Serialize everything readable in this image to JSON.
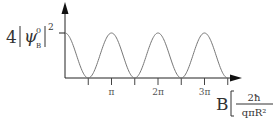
{
  "chart_data": {
    "type": "line",
    "title": "",
    "ylabel": {
      "coefficient": "4",
      "symbol": "ψ",
      "superscript": "0",
      "subscript": "B",
      "power": "2"
    },
    "xlabel": {
      "variable": "B",
      "numerator": "2ħ",
      "denominator": "qπR²"
    },
    "function": "cos^2",
    "x_range_radians": [
      0,
      3.5
    ],
    "y_range": [
      0,
      1
    ],
    "peak_level_label": "4|ψ⁰_B|²",
    "x_ticks": [
      {
        "value": 0.5,
        "label": ""
      },
      {
        "value": 1,
        "label": "π"
      },
      {
        "value": 1.5,
        "label": ""
      },
      {
        "value": 2,
        "label": "2π"
      },
      {
        "value": 2.5,
        "label": ""
      },
      {
        "value": 3,
        "label": "3π"
      },
      {
        "value": 3.5,
        "label": ""
      }
    ],
    "colors": {
      "axis": "#222222",
      "curve": "#777777",
      "text": "#333333"
    },
    "grid": false,
    "legend": "none"
  }
}
